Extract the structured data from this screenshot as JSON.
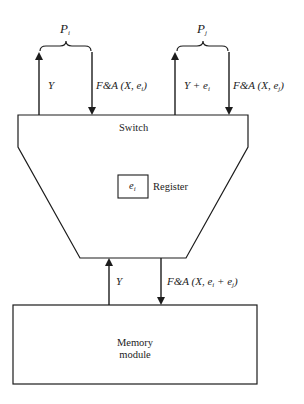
{
  "diagram": {
    "type": "fetch-and-add combining switch",
    "processors": [
      {
        "name": "P",
        "sub": "i",
        "up_label": {
          "main": "Y",
          "sub": ""
        },
        "down_label": {
          "pre": "F&A (X, e",
          "sub": "i",
          "post": ")"
        }
      },
      {
        "name": "P",
        "sub": "j",
        "up_label": {
          "main": "Y + e",
          "sub": "i"
        },
        "down_label": {
          "pre": "F&A (X, e",
          "sub": "j",
          "post": ")"
        }
      }
    ],
    "switch": {
      "label": "Switch",
      "register": {
        "content": "e",
        "content_sub": "i",
        "label": "Register"
      }
    },
    "memory_link": {
      "up_label": "Y",
      "down_label": {
        "pre": "F&A (X, e",
        "sub1": "i",
        "mid": " + e",
        "sub2": "j",
        "post": ")"
      }
    },
    "memory": {
      "line1": "Memory",
      "line2": "module"
    },
    "colors": {
      "stroke": "#1c1c1c",
      "background": "#ffffff"
    }
  }
}
